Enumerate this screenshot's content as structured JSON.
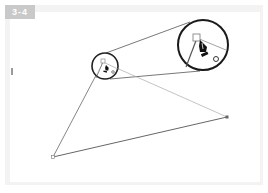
{
  "figure": {
    "label": "3-4",
    "badge_color": "#c9c9c9",
    "frame_color": "#f3f3f3"
  },
  "diagram": {
    "anchor_points": [
      {
        "name": "top",
        "x": 103,
        "y": 62
      },
      {
        "name": "right",
        "x": 227,
        "y": 117
      },
      {
        "name": "bottom-left",
        "x": 53,
        "y": 157
      }
    ],
    "small_circle": {
      "cx": 105,
      "cy": 66,
      "r": 13
    },
    "large_circle": {
      "cx": 203,
      "cy": 45,
      "r": 25
    },
    "tool": "pen-tool-cursor"
  }
}
